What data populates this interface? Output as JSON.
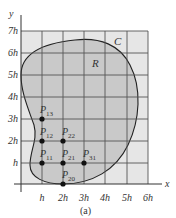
{
  "figure": {
    "caption": "(a)",
    "axis_x_label": "x",
    "axis_y_label": "y",
    "curve_label": "C",
    "region_label": "R",
    "x_ticks": [
      "h",
      "2h",
      "3h",
      "4h",
      "5h",
      "6h"
    ],
    "y_ticks": [
      "h",
      "2h",
      "3h",
      "4h",
      "5h",
      "6h",
      "7h"
    ],
    "points": [
      {
        "name": "P",
        "sub": "13",
        "gx": 1,
        "gy": 3
      },
      {
        "name": "P",
        "sub": "12",
        "gx": 1,
        "gy": 2
      },
      {
        "name": "P",
        "sub": "22",
        "gx": 2,
        "gy": 2
      },
      {
        "name": "P",
        "sub": "11",
        "gx": 1,
        "gy": 1
      },
      {
        "name": "P",
        "sub": "21",
        "gx": 2,
        "gy": 1
      },
      {
        "name": "P",
        "sub": "31",
        "gx": 3,
        "gy": 1
      },
      {
        "name": "P",
        "sub": "20",
        "gx": 2,
        "gy": 0
      }
    ],
    "colors": {
      "grid_fill": "#e6e6e6",
      "region_fill": "#c9c9c9",
      "grid_line": "#555555",
      "curve": "#222222",
      "point": "#111111"
    }
  }
}
